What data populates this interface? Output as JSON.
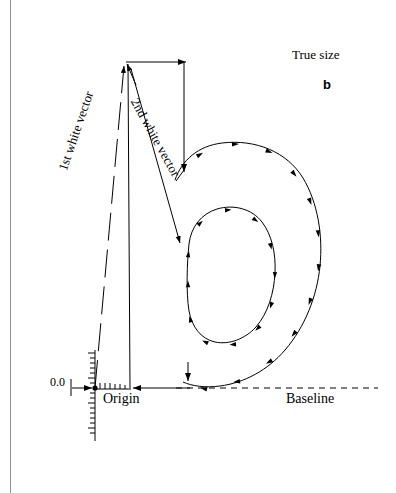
{
  "figure": {
    "caption": "True size",
    "subcaption": "b",
    "labels": {
      "origin": "Origin",
      "baseline": "Baseline",
      "zero": "0.0",
      "first_white_vector": "1st white vector",
      "second_white_vector": "2nd white vector"
    },
    "colors": {
      "ink": "#000000",
      "page_edge": "#8f8f8f",
      "background": "#ffffff"
    },
    "glyph": "b",
    "annotations": {
      "outer_contour_direction": "clockwise",
      "inner_contour_direction": "counter-clockwise",
      "origin_point": [
        95,
        388
      ],
      "baseline_y": 388
    }
  }
}
